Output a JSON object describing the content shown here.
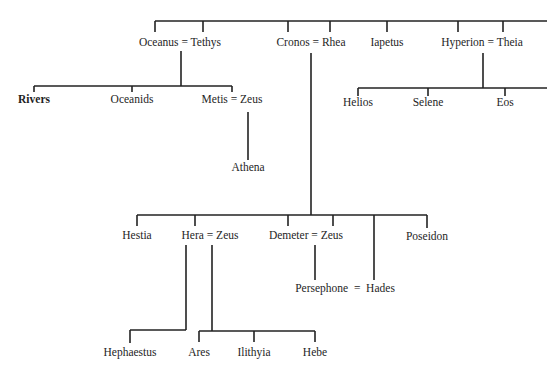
{
  "diagram": {
    "type": "family-tree",
    "nodes": [
      {
        "id": "oceanus_tethys",
        "label": "Oceanus = Tethys",
        "x": 180,
        "y": 36
      },
      {
        "id": "cronos_rhea",
        "label": "Cronos = Rhea",
        "x": 311,
        "y": 36
      },
      {
        "id": "iapetus",
        "label": "Iapetus",
        "x": 387,
        "y": 36
      },
      {
        "id": "hyperion_theia",
        "label": "Hyperion = Theia",
        "x": 482,
        "y": 36
      },
      {
        "id": "rivers",
        "label": "Rivers",
        "x": 34,
        "y": 93,
        "bold": true
      },
      {
        "id": "oceanids",
        "label": "Oceanids",
        "x": 132,
        "y": 93
      },
      {
        "id": "metis_zeus",
        "label": "Metis = Zeus",
        "x": 232,
        "y": 93
      },
      {
        "id": "athena",
        "label": "Athena",
        "x": 248,
        "y": 161
      },
      {
        "id": "helios",
        "label": "Helios",
        "x": 358,
        "y": 96
      },
      {
        "id": "selene",
        "label": "Selene",
        "x": 428,
        "y": 96
      },
      {
        "id": "eos",
        "label": "Eos",
        "x": 505,
        "y": 96
      },
      {
        "id": "hestia",
        "label": "Hestia",
        "x": 137,
        "y": 229
      },
      {
        "id": "hera_zeus",
        "label": "Hera = Zeus",
        "x": 210,
        "y": 229
      },
      {
        "id": "demeter_zeus",
        "label": "Demeter = Zeus",
        "x": 306,
        "y": 229
      },
      {
        "id": "poseidon",
        "label": "Poseidon",
        "x": 427,
        "y": 230
      },
      {
        "id": "persephone_hades",
        "label": "Persephone  =  Hades",
        "x": 345,
        "y": 282
      },
      {
        "id": "hephaestus",
        "label": "Hephaestus",
        "x": 130,
        "y": 346
      },
      {
        "id": "ares",
        "label": "Ares",
        "x": 199,
        "y": 346
      },
      {
        "id": "ilithyia",
        "label": "Ilithyia",
        "x": 254,
        "y": 346
      },
      {
        "id": "hebe",
        "label": "Hebe",
        "x": 315,
        "y": 346
      }
    ],
    "edges": [
      {
        "x1": 155,
        "y1": 21,
        "x2": 547,
        "y2": 21
      },
      {
        "x1": 155,
        "y1": 21,
        "x2": 155,
        "y2": 32
      },
      {
        "x1": 203,
        "y1": 21,
        "x2": 203,
        "y2": 32
      },
      {
        "x1": 288,
        "y1": 21,
        "x2": 288,
        "y2": 32
      },
      {
        "x1": 330,
        "y1": 21,
        "x2": 330,
        "y2": 32
      },
      {
        "x1": 387,
        "y1": 21,
        "x2": 387,
        "y2": 32
      },
      {
        "x1": 458,
        "y1": 21,
        "x2": 458,
        "y2": 32
      },
      {
        "x1": 503,
        "y1": 21,
        "x2": 503,
        "y2": 32
      },
      {
        "x1": 181,
        "y1": 51,
        "x2": 181,
        "y2": 86
      },
      {
        "x1": 34,
        "y1": 86,
        "x2": 232,
        "y2": 86
      },
      {
        "x1": 34,
        "y1": 86,
        "x2": 34,
        "y2": 92
      },
      {
        "x1": 132,
        "y1": 86,
        "x2": 132,
        "y2": 92
      },
      {
        "x1": 232,
        "y1": 86,
        "x2": 232,
        "y2": 92
      },
      {
        "x1": 248,
        "y1": 112,
        "x2": 248,
        "y2": 160
      },
      {
        "x1": 483,
        "y1": 53,
        "x2": 483,
        "y2": 88
      },
      {
        "x1": 358,
        "y1": 88,
        "x2": 547,
        "y2": 88
      },
      {
        "x1": 358,
        "y1": 88,
        "x2": 358,
        "y2": 96
      },
      {
        "x1": 428,
        "y1": 88,
        "x2": 428,
        "y2": 96
      },
      {
        "x1": 505,
        "y1": 88,
        "x2": 505,
        "y2": 96
      },
      {
        "x1": 311,
        "y1": 53,
        "x2": 311,
        "y2": 215
      },
      {
        "x1": 137,
        "y1": 215,
        "x2": 427,
        "y2": 215
      },
      {
        "x1": 137,
        "y1": 215,
        "x2": 137,
        "y2": 226
      },
      {
        "x1": 195,
        "y1": 215,
        "x2": 195,
        "y2": 226
      },
      {
        "x1": 288,
        "y1": 215,
        "x2": 288,
        "y2": 226
      },
      {
        "x1": 333,
        "y1": 215,
        "x2": 333,
        "y2": 226
      },
      {
        "x1": 374,
        "y1": 215,
        "x2": 374,
        "y2": 280
      },
      {
        "x1": 427,
        "y1": 215,
        "x2": 427,
        "y2": 228
      },
      {
        "x1": 315,
        "y1": 245,
        "x2": 315,
        "y2": 280
      },
      {
        "x1": 186,
        "y1": 245,
        "x2": 186,
        "y2": 330
      },
      {
        "x1": 130,
        "y1": 330,
        "x2": 186,
        "y2": 330
      },
      {
        "x1": 130,
        "y1": 330,
        "x2": 130,
        "y2": 343
      },
      {
        "x1": 212,
        "y1": 245,
        "x2": 212,
        "y2": 331
      },
      {
        "x1": 199,
        "y1": 331,
        "x2": 315,
        "y2": 331
      },
      {
        "x1": 199,
        "y1": 331,
        "x2": 199,
        "y2": 342
      },
      {
        "x1": 254,
        "y1": 331,
        "x2": 254,
        "y2": 342
      },
      {
        "x1": 315,
        "y1": 331,
        "x2": 315,
        "y2": 342
      }
    ]
  }
}
